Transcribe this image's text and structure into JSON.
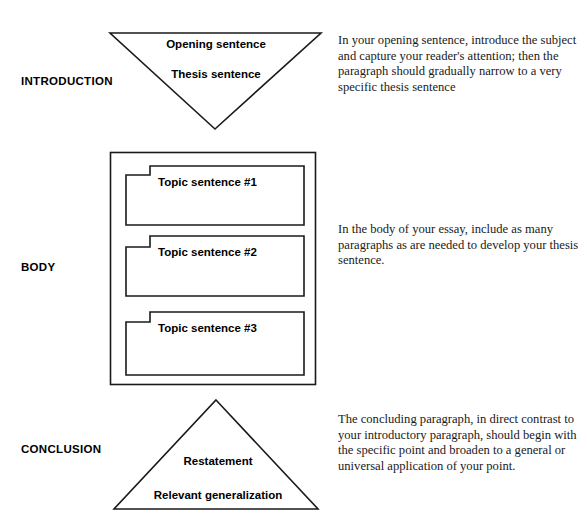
{
  "diagram": {
    "background_color": "#ffffff",
    "stroke_color": "#1a1a1a",
    "sections": [
      {
        "label": "INTRODUCTION",
        "shape": "inverted-triangle",
        "shape_texts": [
          "Opening sentence",
          "Thesis sentence"
        ],
        "note": "In your opening sentence, introduce the subject and capture your reader's attention; then the paragraph should gradually narrow to a very specific thesis sentence"
      },
      {
        "label": "BODY",
        "shape": "rectangle-with-paragraph-boxes",
        "shape_texts": [
          "Topic sentence #1",
          "Topic sentence #2",
          "Topic sentence #3"
        ],
        "note": "In the body of your essay, include as many paragraphs as are needed to develop your thesis sentence."
      },
      {
        "label": "CONCLUSION",
        "shape": "triangle",
        "shape_texts": [
          "Restatement",
          "Relevant generalization"
        ],
        "note": "The concluding paragraph, in direct contrast to your introductory paragraph, should begin with the specific point and broaden to a general or universal application of your point."
      }
    ]
  }
}
